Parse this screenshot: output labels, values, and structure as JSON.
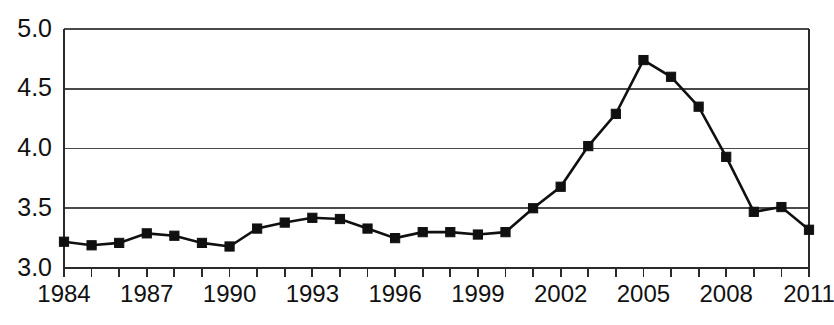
{
  "chart_data": {
    "type": "line",
    "title": "",
    "subtitle": "",
    "xlabel": "",
    "ylabel": "",
    "x": [
      1984,
      1985,
      1986,
      1987,
      1988,
      1989,
      1990,
      1991,
      1992,
      1993,
      1994,
      1995,
      1996,
      1997,
      1998,
      1999,
      2000,
      2001,
      2002,
      2003,
      2004,
      2005,
      2006,
      2007,
      2008,
      2009,
      2010,
      2011
    ],
    "values": [
      3.22,
      3.19,
      3.21,
      3.29,
      3.27,
      3.21,
      3.18,
      3.33,
      3.38,
      3.42,
      3.41,
      3.33,
      3.25,
      3.3,
      3.3,
      3.28,
      3.3,
      3.5,
      3.68,
      4.02,
      4.29,
      4.74,
      4.6,
      4.35,
      3.93,
      3.47,
      3.51,
      3.32
    ],
    "xlim": [
      1984,
      2011
    ],
    "ylim": [
      3.0,
      5.0
    ],
    "ytick_labels": [
      "5.0",
      "4.5",
      "4.0",
      "3.5",
      "3.0"
    ],
    "ytick_values": [
      5.0,
      4.5,
      4.0,
      3.5,
      3.0
    ],
    "xtick_labels": [
      "1984",
      "1987",
      "1990",
      "1993",
      "1996",
      "1999",
      "2002",
      "2005",
      "2008",
      "2011"
    ],
    "xtick_values": [
      1984,
      1987,
      1990,
      1993,
      1996,
      1999,
      2002,
      2005,
      2008,
      2011
    ],
    "xtick_minor_values": [
      1984,
      1985,
      1986,
      1987,
      1988,
      1989,
      1990,
      1991,
      1992,
      1993,
      1994,
      1995,
      1996,
      1997,
      1998,
      1999,
      2000,
      2001,
      2002,
      2003,
      2004,
      2005,
      2006,
      2007,
      2008,
      2009,
      2010,
      2011
    ],
    "grid": true,
    "grid_axis": "y",
    "legend": false,
    "legend_position": "none",
    "marker": "square",
    "line_color": "#101010",
    "marker_color": "#101010",
    "grid_color": "#4a4a4a",
    "background_color": "#ffffff",
    "annotations": []
  },
  "plot_geometry": {
    "left": 64,
    "right": 809,
    "top": 29,
    "bottom": 268
  }
}
